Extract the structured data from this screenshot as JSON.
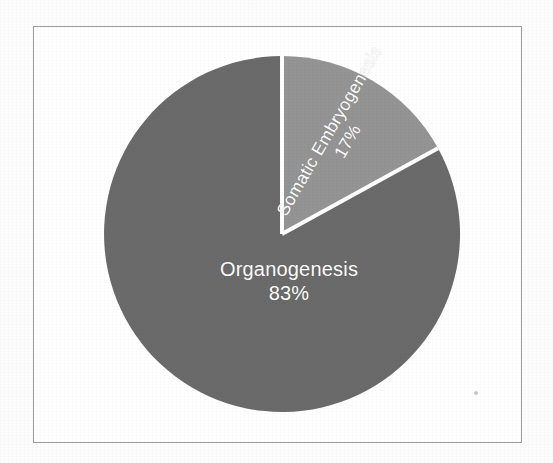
{
  "figure": {
    "background_color": "#fdfdfd",
    "frame_color": "#9b9b9b",
    "label_text_color": "#ffffff"
  },
  "chart_data": {
    "type": "pie",
    "title": "",
    "subtitle": "",
    "xlabel": "",
    "ylabel": "",
    "legend_position": "none",
    "grid": false,
    "labels_inside_slices": true,
    "value_format": "percent",
    "categories": [
      "Organogenesis",
      "Somatic Embryogenesis"
    ],
    "values": [
      83,
      17
    ],
    "colors": [
      "#6b6b6b",
      "#949494"
    ],
    "slices": [
      {
        "label": "Organogenesis",
        "value": 83,
        "value_label": "83%",
        "color": "#6b6b6b",
        "start_angle_deg": 61.2,
        "end_angle_deg": 360,
        "label_rotation_deg": 0
      },
      {
        "label": "Somatic Embryogenesis",
        "value": 17,
        "value_label": "17%",
        "color": "#949494",
        "start_angle_deg": 0,
        "end_angle_deg": 61.2,
        "label_rotation_deg": -60
      }
    ],
    "total": 100,
    "units": "%"
  },
  "geometry": {
    "center_x": 248,
    "center_y": 207,
    "radius": 178,
    "separator_color": "#ffffff",
    "separator_width": 4
  }
}
